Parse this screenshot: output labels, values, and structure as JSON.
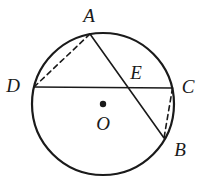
{
  "figure": {
    "type": "geometry-diagram",
    "colors": {
      "stroke": "#1a1a1a",
      "background": "#ffffff",
      "label": "#1a1a1a"
    },
    "circle": {
      "center": {
        "x": 103,
        "y": 104
      },
      "radius": 71,
      "stroke_width": 2.2
    },
    "center_dot": {
      "x": 103,
      "y": 104,
      "radius": 3.2
    },
    "points": {
      "A": {
        "x": 90,
        "y": 34
      },
      "B": {
        "x": 164,
        "y": 138
      },
      "C": {
        "x": 172.5,
        "y": 88
      },
      "D": {
        "x": 34,
        "y": 87
      },
      "E": {
        "x": 133,
        "y": 87
      },
      "O": {
        "x": 103,
        "y": 104
      }
    },
    "segments": [
      {
        "name": "chord-DC",
        "from": "D",
        "to": "C",
        "style": "solid",
        "stroke_width": 1.6
      },
      {
        "name": "chord-AB",
        "from": "A",
        "to": "B",
        "style": "solid",
        "stroke_width": 1.6
      },
      {
        "name": "segment-AD",
        "from": "A",
        "to": "D",
        "style": "dashed",
        "stroke_width": 1.6
      },
      {
        "name": "segment-CB",
        "from": "C",
        "to": "B",
        "style": "dashed",
        "stroke_width": 1.6
      }
    ],
    "labels": [
      {
        "id": "A",
        "text": "A",
        "x": 89,
        "y": 15
      },
      {
        "id": "D",
        "text": "D",
        "x": 13,
        "y": 85
      },
      {
        "id": "E",
        "text": "E",
        "x": 136,
        "y": 72
      },
      {
        "id": "C",
        "text": "C",
        "x": 188,
        "y": 86
      },
      {
        "id": "B",
        "text": "B",
        "x": 180,
        "y": 149
      },
      {
        "id": "O",
        "text": "O",
        "x": 103,
        "y": 123
      }
    ]
  }
}
